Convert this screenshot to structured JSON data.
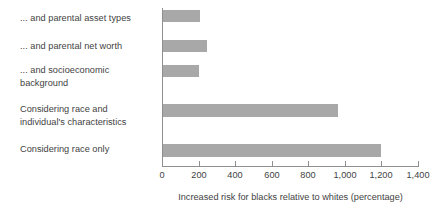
{
  "chart_data": {
    "type": "bar",
    "orientation": "horizontal",
    "title": "",
    "xlabel": "Increased risk for blacks relative to whites (percentage)",
    "ylabel": "",
    "categories": [
      "... and parental asset types",
      "... and parental net worth",
      "... and socioeconomic background",
      "Considering race and individual's characteristics",
      "Considering race only"
    ],
    "values": [
      210,
      245,
      200,
      965,
      1195
    ],
    "xlim": [
      0,
      1400
    ],
    "xticks": [
      0,
      200,
      400,
      600,
      800,
      1000,
      1200,
      1400
    ],
    "xticklabels": [
      "0",
      "200",
      "400",
      "600",
      "800",
      "1,000",
      "1,200",
      "1,400"
    ],
    "grid": false,
    "legend": null,
    "bar_color": "#a8a8a8",
    "axis_color": "#8f8f8f",
    "text_color": "#3f3f3f"
  },
  "labels": {
    "row0_line1": "... and parental asset types",
    "row1_line1": "... and parental net worth",
    "row2_line1": "... and socioeconomic",
    "row2_line2": "background",
    "row3_line1": "Considering race and",
    "row3_line2": "individual's characteristics",
    "row4_line1": "Considering race only"
  },
  "axis": {
    "caption": "Increased risk for blacks relative to whites (percentage)",
    "t0": "0",
    "t1": "200",
    "t2": "400",
    "t3": "600",
    "t4": "800",
    "t5": "1,000",
    "t6": "1,200",
    "t7": "1,400"
  }
}
